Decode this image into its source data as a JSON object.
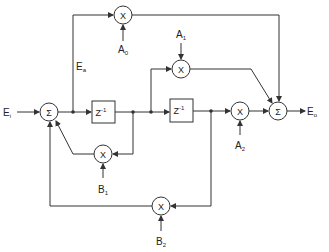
{
  "diagram": {
    "type": "signal-flow",
    "input": {
      "label": "E",
      "sub": "i"
    },
    "output": {
      "label": "E",
      "sub": "o"
    },
    "intermediate": {
      "label": "E",
      "sub": "a"
    },
    "summers": [
      {
        "id": "sum1",
        "symbol": "Σ"
      },
      {
        "id": "sum2",
        "symbol": "Σ"
      }
    ],
    "delays": [
      {
        "id": "z1",
        "label": "Z",
        "exp": "-1"
      },
      {
        "id": "z2",
        "label": "Z",
        "exp": "-1"
      }
    ],
    "multipliers": [
      {
        "id": "mA0",
        "symbol": "X",
        "coef": "A",
        "sub": "0"
      },
      {
        "id": "mA1",
        "symbol": "X",
        "coef": "A",
        "sub": "1"
      },
      {
        "id": "mA2",
        "symbol": "X",
        "coef": "A",
        "sub": "2"
      },
      {
        "id": "mB1",
        "symbol": "X",
        "coef": "B",
        "sub": "1"
      },
      {
        "id": "mB2",
        "symbol": "X",
        "coef": "B",
        "sub": "2"
      }
    ]
  }
}
